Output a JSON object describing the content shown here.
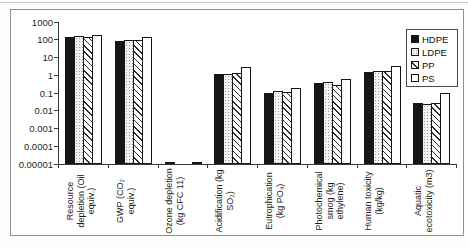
{
  "figure": {
    "background": "#ffffff",
    "frame_border_color": "#909090",
    "axis_color": "#3a3a3a",
    "bar_colors": {
      "hdpe_fill": "#161616",
      "outline": "#161616",
      "hatch": "#2b2b2b",
      "dot": "#9b9b9b"
    }
  },
  "legend": {
    "position": "top-right",
    "items": [
      {
        "label": "HDPE",
        "pattern": "solid-black"
      },
      {
        "label": "LDPE",
        "pattern": "dotted-light"
      },
      {
        "label": "PP",
        "pattern": "diagonal-hatch"
      },
      {
        "label": "PS",
        "pattern": "plain-white"
      }
    ]
  },
  "chart_data": {
    "type": "bar",
    "y_scale": "log10",
    "ylim": [
      1e-05,
      1000
    ],
    "grid": false,
    "legend_position": "top-right",
    "y_ticks": [
      "1000",
      "100",
      "10",
      "1",
      "0.1",
      "0.01",
      "0.001",
      "0.0001",
      "0.00001"
    ],
    "categories": [
      "Resource depletion (Oil equiv.)",
      "GWP (CO₂ equiv.)",
      "Ozone depletion (kg CFC 11)",
      "Acidification (kg SO₂)",
      "Eutrophication (kg PO₄)",
      "Photochemical smog (kg ethylene)",
      "Human toxicity (kg/kg)",
      "Aquatic ecotoxicity (m3)"
    ],
    "series": [
      {
        "name": "HDPE",
        "values": [
          150,
          90,
          1.3e-05,
          1.2,
          0.11,
          0.4,
          1.6,
          0.028
        ]
      },
      {
        "name": "LDPE",
        "values": [
          160,
          105,
          null,
          1.3,
          0.13,
          0.42,
          1.8,
          0.024
        ]
      },
      {
        "name": "PP",
        "values": [
          150,
          95,
          null,
          1.4,
          0.12,
          0.3,
          1.8,
          0.027
        ]
      },
      {
        "name": "PS",
        "values": [
          200,
          145,
          1.3e-05,
          3.2,
          0.2,
          0.65,
          3.5,
          0.1
        ]
      }
    ]
  }
}
